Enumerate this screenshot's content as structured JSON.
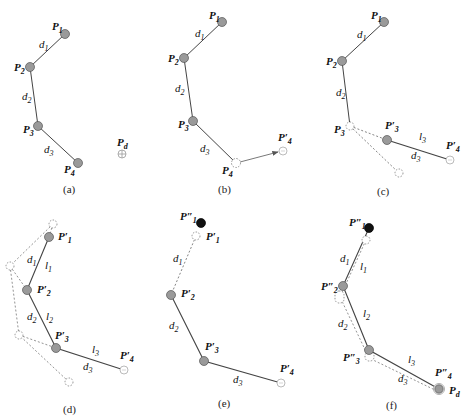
{
  "figure": {
    "panels": [
      {
        "id": "a",
        "caption": "(a)",
        "points": [
          {
            "label": "P",
            "sub": "1",
            "x": 65,
            "y": 34,
            "style": "filled"
          },
          {
            "label": "P",
            "sub": "2",
            "x": 30,
            "y": 67,
            "style": "filled"
          },
          {
            "label": "P",
            "sub": "3",
            "x": 38,
            "y": 126,
            "style": "filled"
          },
          {
            "label": "P",
            "sub": "4",
            "x": 78,
            "y": 163,
            "style": "filled"
          },
          {
            "label": "P",
            "sub": "d",
            "x": 122,
            "y": 154,
            "style": "target"
          }
        ],
        "segments": [
          "d1",
          "d2",
          "d3"
        ]
      },
      {
        "id": "b",
        "caption": "(b)",
        "points": [
          {
            "label": "P",
            "sub": "1",
            "x": 222,
            "y": 22,
            "style": "filled"
          },
          {
            "label": "P",
            "sub": "2",
            "x": 184,
            "y": 58,
            "style": "filled"
          },
          {
            "label": "P",
            "sub": "3",
            "x": 193,
            "y": 121,
            "style": "filled"
          },
          {
            "label": "P",
            "sub": "4",
            "x": 236,
            "y": 163,
            "style": "dashed"
          },
          {
            "label": "P′",
            "sub": "4",
            "x": 283,
            "y": 151,
            "style": "target"
          }
        ],
        "segments": [
          "d1",
          "d2",
          "d3"
        ]
      },
      {
        "id": "c",
        "caption": "(c)",
        "points": [
          {
            "label": "P",
            "sub": "1",
            "x": 384,
            "y": 22,
            "style": "filled"
          },
          {
            "label": "P",
            "sub": "2",
            "x": 342,
            "y": 61,
            "style": "filled"
          },
          {
            "label": "P",
            "sub": "3",
            "x": 350,
            "y": 126,
            "style": "dashed"
          },
          {
            "label": "P′",
            "sub": "3",
            "x": 387,
            "y": 140,
            "style": "filled"
          },
          {
            "label": "P′",
            "sub": "4",
            "x": 450,
            "y": 160,
            "style": "target"
          }
        ],
        "segments": [
          "d1",
          "d2",
          "d3",
          "l3"
        ]
      },
      {
        "id": "d",
        "caption": "(d)",
        "points": [
          {
            "label": "P′",
            "sub": "1",
            "x": 49,
            "y": 237,
            "style": "filled"
          },
          {
            "label": "P′",
            "sub": "2",
            "x": 27,
            "y": 290,
            "style": "filled"
          },
          {
            "label": "P′",
            "sub": "3",
            "x": 56,
            "y": 348,
            "style": "filled"
          },
          {
            "label": "P′",
            "sub": "4",
            "x": 124,
            "y": 370,
            "style": "target"
          }
        ],
        "segments": [
          "d1",
          "l1",
          "d2",
          "l2",
          "d3",
          "l3"
        ]
      },
      {
        "id": "e",
        "caption": "(e)",
        "points": [
          {
            "label": "P″",
            "sub": "1",
            "x": 201,
            "y": 223,
            "style": "black"
          },
          {
            "label": "P′",
            "sub": "1",
            "x": 196,
            "y": 236,
            "style": "dashed"
          },
          {
            "label": "P′",
            "sub": "2",
            "x": 171,
            "y": 295,
            "style": "filled"
          },
          {
            "label": "P′",
            "sub": "3",
            "x": 204,
            "y": 361,
            "style": "filled"
          },
          {
            "label": "P′",
            "sub": "4",
            "x": 281,
            "y": 383,
            "style": "target"
          }
        ],
        "segments": [
          "d1",
          "d2",
          "d3"
        ]
      },
      {
        "id": "f",
        "caption": "(f)",
        "points": [
          {
            "label": "P″",
            "sub": "1",
            "x": 369,
            "y": 228,
            "style": "black"
          },
          {
            "label": "P″",
            "sub": "2",
            "x": 343,
            "y": 286,
            "style": "filled"
          },
          {
            "label": "P″",
            "sub": "3",
            "x": 369,
            "y": 350,
            "style": "filled"
          },
          {
            "label": "P″",
            "sub": "4",
            "x": 439,
            "y": 389,
            "style": "filled"
          },
          {
            "label": "P",
            "sub": "d",
            "x": 439,
            "y": 389,
            "style": "target"
          }
        ],
        "segments": [
          "d1",
          "l1",
          "d2",
          "l2",
          "d3",
          "l3"
        ]
      }
    ]
  },
  "text": {
    "P": "P",
    "Pp": "P′",
    "Ppp": "P″",
    "s1": "1",
    "s2": "2",
    "s3": "3",
    "s4": "4",
    "sd": "d",
    "d": "d",
    "l": "l",
    "cap_a": "(a)",
    "cap_b": "(b)",
    "cap_c": "(c)",
    "cap_d": "(d)",
    "cap_e": "(e)",
    "cap_f": "(f)"
  },
  "colors": {
    "joint_fill": "#9a9a9a",
    "joint_stroke": "#555555",
    "target_stroke": "#aaaaaa",
    "line": "#444444",
    "dashed": "#666666",
    "black_point": "#111111"
  }
}
